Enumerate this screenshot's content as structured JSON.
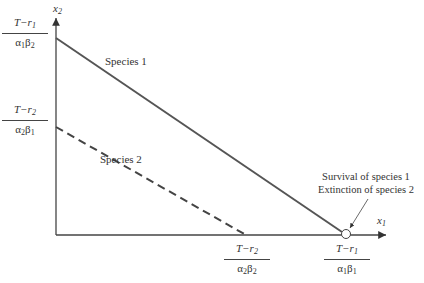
{
  "diagram": {
    "type": "phase-plane",
    "axes": {
      "x_label": {
        "var": "x",
        "sub": "1"
      },
      "y_label": {
        "var": "x",
        "sub": "2"
      }
    },
    "y_ticks": [
      {
        "num_var": "T−r",
        "num_sub": "1",
        "den": "α",
        "den_sub1": "1",
        "den2": "β",
        "den_sub2": "2"
      },
      {
        "num_var": "T−r",
        "num_sub": "2",
        "den": "α",
        "den_sub1": "2",
        "den2": "β",
        "den_sub2": "1"
      }
    ],
    "x_ticks": [
      {
        "num_var": "T−r",
        "num_sub": "2",
        "den": "α",
        "den_sub1": "2",
        "den2": "β",
        "den_sub2": "2"
      },
      {
        "num_var": "T−r",
        "num_sub": "1",
        "den": "α",
        "den_sub1": "1",
        "den2": "β",
        "den_sub2": "1"
      }
    ],
    "lines": [
      {
        "label": "Species 1",
        "style": "solid"
      },
      {
        "label": "Species 2",
        "style": "dashed"
      }
    ],
    "annotation": {
      "line1": "Survival of species 1",
      "line2": "Extinction of species 2"
    },
    "colors": {
      "line": "#555555",
      "axis": "#444444",
      "text": "#333333"
    }
  }
}
